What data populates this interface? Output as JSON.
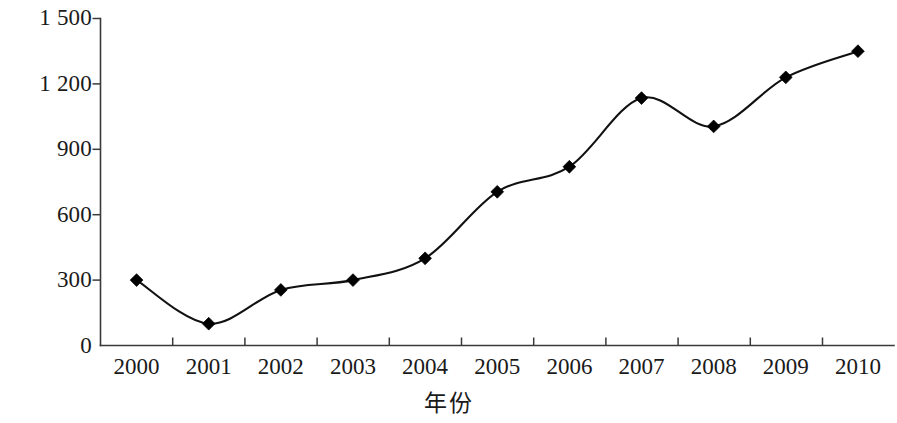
{
  "chart_data": {
    "type": "line",
    "title": "",
    "xlabel": "年份",
    "ylabel": "废物排放量/万吨",
    "categories": [
      "2000",
      "2001",
      "2002",
      "2003",
      "2004",
      "2005",
      "2006",
      "2007",
      "2008",
      "2009",
      "2010"
    ],
    "values": [
      300,
      100,
      255,
      300,
      400,
      705,
      820,
      1135,
      1005,
      1230,
      1350
    ],
    "series": [
      {
        "name": "废物排放量",
        "values": [
          300,
          100,
          255,
          300,
          400,
          705,
          820,
          1135,
          1005,
          1230,
          1350
        ]
      }
    ],
    "ylim": [
      0,
      1500
    ],
    "y_ticks": [
      0,
      300,
      600,
      900,
      1200,
      1500
    ],
    "y_tick_labels": [
      "0",
      "300",
      "600",
      "900",
      "1 200",
      "1 500"
    ],
    "grid": false,
    "legend": "none",
    "marker": "diamond",
    "line_color": "#111111",
    "marker_color": "#000000",
    "axis_color": "#3a3a3a",
    "smoothing": "spline"
  },
  "axes": {
    "y_title": "废物排放量/万吨",
    "x_title": "年份"
  }
}
